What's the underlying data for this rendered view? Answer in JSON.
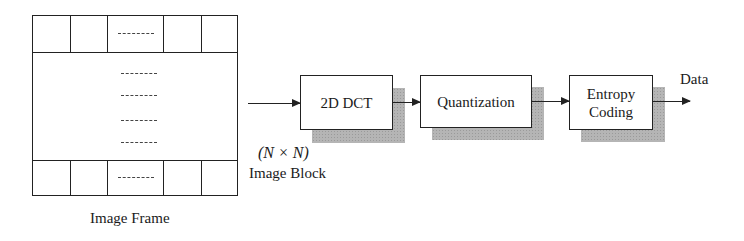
{
  "diagram": {
    "type": "block-diagram",
    "frame": {
      "label": "Image Frame",
      "rows": [
        "top-row of 5 blocks",
        "middle region",
        "bottom-row of 5 blocks"
      ],
      "ellipsis": "-----",
      "middle_ellipsis_count": 4
    },
    "input": {
      "size_label": "(N × N)",
      "block_label": "Image Block"
    },
    "stages": [
      {
        "id": "dct",
        "label": "2D DCT"
      },
      {
        "id": "quant",
        "label": "Quantization"
      },
      {
        "id": "entropy",
        "label_line1": "Entropy",
        "label_line2": "Coding"
      }
    ],
    "output": {
      "label": "Data"
    },
    "edges": [
      {
        "from": "input",
        "to": "dct"
      },
      {
        "from": "dct",
        "to": "quant"
      },
      {
        "from": "quant",
        "to": "entropy"
      },
      {
        "from": "entropy",
        "to": "output"
      }
    ],
    "colors": {
      "line": "#222222",
      "shadow": "#b5b5b5",
      "background": "#ffffff"
    }
  }
}
